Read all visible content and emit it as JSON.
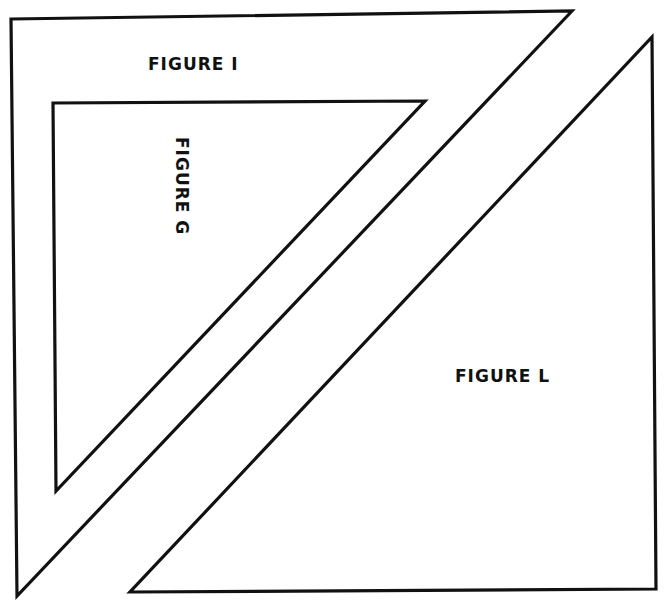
{
  "diagram": {
    "top_clipped_text": "",
    "stroke_color": "#111111",
    "background_color": "#ffffff",
    "figures": [
      {
        "id": "I",
        "label": "FIGURE I",
        "shape": "right-triangle-frame",
        "label_orientation": "horizontal"
      },
      {
        "id": "G",
        "label": "FIGURE G",
        "shape": "right-triangle",
        "label_orientation": "vertical-rotated-clockwise"
      },
      {
        "id": "L",
        "label": "FIGURE L",
        "shape": "right-triangle",
        "label_orientation": "horizontal"
      }
    ]
  }
}
